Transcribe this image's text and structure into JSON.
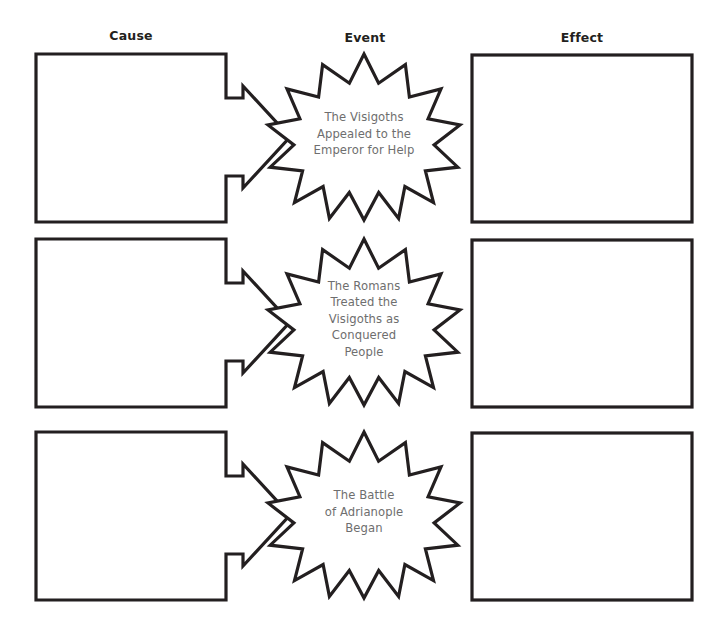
{
  "page": {
    "background_color": "#ffffff",
    "line_color": "#231f20",
    "star_text_color": "#6e6e6e"
  },
  "headers": {
    "cause": "Cause",
    "event": "Event",
    "effect": "Effect"
  },
  "rows": [
    {
      "cause_box_value": "",
      "cause_box_placeholder": "",
      "arrow": "right-arrow",
      "event_text": "The Visigoths\nAppealed to the\nEmperor for Help",
      "effect_box_value": "",
      "effect_box_placeholder": ""
    },
    {
      "cause_box_value": "",
      "cause_box_placeholder": "",
      "arrow": "right-arrow",
      "event_text": "The Romans\nTreated the\nVisigoths as\nConquered\nPeople",
      "effect_box_value": "",
      "effect_box_placeholder": ""
    },
    {
      "cause_box_value": "",
      "cause_box_placeholder": "",
      "arrow": "right-arrow",
      "event_text": "The Battle\nof Adrianople\nBegan",
      "effect_box_value": "",
      "effect_box_placeholder": ""
    }
  ]
}
